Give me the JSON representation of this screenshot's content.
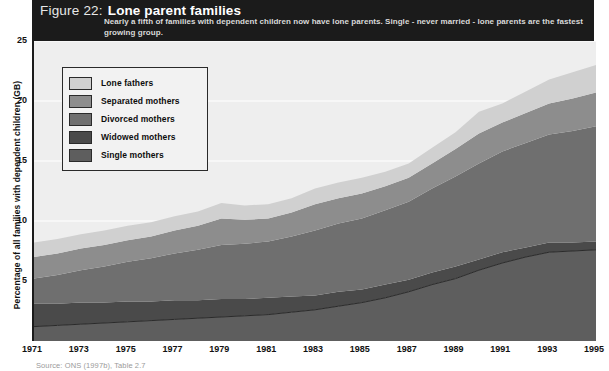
{
  "header": {
    "figure_number": "Figure 22:",
    "title": "Lone parent families",
    "subtitle": "Nearly a fifth of families with dependent children now have lone parents. Single - never married - lone parents are the fastest growing group."
  },
  "source": "Source: ONS (1997b), Table 2.7",
  "legend": {
    "items": [
      {
        "label": "Lone fathers",
        "color": "#d0d0d0"
      },
      {
        "label": "Separated mothers",
        "color": "#8d8d8d"
      },
      {
        "label": "Divorced mothers",
        "color": "#6f6f6f"
      },
      {
        "label": "Widowed mothers",
        "color": "#4a4a4a"
      },
      {
        "label": "Single mothers",
        "color": "#5e5e5e"
      }
    ]
  },
  "chart_data": {
    "type": "area",
    "stacked": true,
    "title": "Lone parent families",
    "subtitle": "Nearly a fifth of families with dependent children now have lone parents. Single - never married - lone parents are the fastest growing group.",
    "xlabel": "",
    "ylabel": "Percentage of all families with dependent children (GB)",
    "xlim": [
      1971,
      1995
    ],
    "ylim": [
      0,
      25
    ],
    "yticks": [
      5,
      10,
      15,
      20,
      25
    ],
    "xticks": [
      1971,
      1973,
      1975,
      1977,
      1979,
      1981,
      1983,
      1985,
      1987,
      1989,
      1991,
      1993,
      1995
    ],
    "grid": true,
    "legend_position": "upper-left-inset",
    "background": "#eeeeee",
    "x": [
      1971,
      1972,
      1973,
      1974,
      1975,
      1976,
      1977,
      1978,
      1979,
      1980,
      1981,
      1982,
      1983,
      1984,
      1985,
      1986,
      1987,
      1988,
      1989,
      1990,
      1991,
      1992,
      1993,
      1994,
      1995
    ],
    "series": [
      {
        "name": "Single mothers",
        "color": "#5e5e5e",
        "values": [
          1.2,
          1.3,
          1.4,
          1.5,
          1.6,
          1.7,
          1.8,
          1.9,
          2.0,
          2.1,
          2.2,
          2.4,
          2.6,
          2.9,
          3.2,
          3.6,
          4.1,
          4.7,
          5.2,
          5.9,
          6.5,
          7.0,
          7.4,
          7.5,
          7.6
        ]
      },
      {
        "name": "Widowed mothers",
        "color": "#4a4a4a",
        "values": [
          1.9,
          1.8,
          1.8,
          1.7,
          1.7,
          1.6,
          1.6,
          1.5,
          1.5,
          1.4,
          1.4,
          1.3,
          1.2,
          1.2,
          1.1,
          1.1,
          1.0,
          1.0,
          1.0,
          0.9,
          0.9,
          0.8,
          0.8,
          0.7,
          0.7
        ]
      },
      {
        "name": "Divorced mothers",
        "color": "#6f6f6f",
        "values": [
          2.1,
          2.4,
          2.7,
          3.0,
          3.3,
          3.6,
          3.9,
          4.2,
          4.5,
          4.6,
          4.7,
          5.0,
          5.4,
          5.7,
          5.9,
          6.2,
          6.5,
          7.0,
          7.5,
          8.0,
          8.4,
          8.7,
          9.0,
          9.3,
          9.6
        ]
      },
      {
        "name": "Separated mothers",
        "color": "#8d8d8d",
        "values": [
          1.8,
          1.8,
          1.8,
          1.8,
          1.8,
          1.8,
          1.9,
          2.0,
          2.2,
          2.0,
          1.9,
          2.0,
          2.2,
          2.1,
          2.1,
          2.0,
          2.0,
          2.1,
          2.3,
          2.5,
          2.4,
          2.5,
          2.6,
          2.7,
          2.8
        ]
      },
      {
        "name": "Lone fathers",
        "color": "#d0d0d0",
        "values": [
          1.2,
          1.2,
          1.2,
          1.2,
          1.2,
          1.2,
          1.2,
          1.2,
          1.3,
          1.2,
          1.2,
          1.2,
          1.3,
          1.3,
          1.3,
          1.2,
          1.2,
          1.3,
          1.4,
          1.8,
          1.6,
          1.8,
          2.0,
          2.2,
          2.3
        ]
      }
    ],
    "totals": [
      8.2,
      8.5,
      8.9,
      9.2,
      9.6,
      9.9,
      10.4,
      10.8,
      11.5,
      11.3,
      11.4,
      11.9,
      12.7,
      13.2,
      13.6,
      14.1,
      14.8,
      16.1,
      17.4,
      19.1,
      19.8,
      20.8,
      21.8,
      22.4,
      23.0
    ]
  }
}
